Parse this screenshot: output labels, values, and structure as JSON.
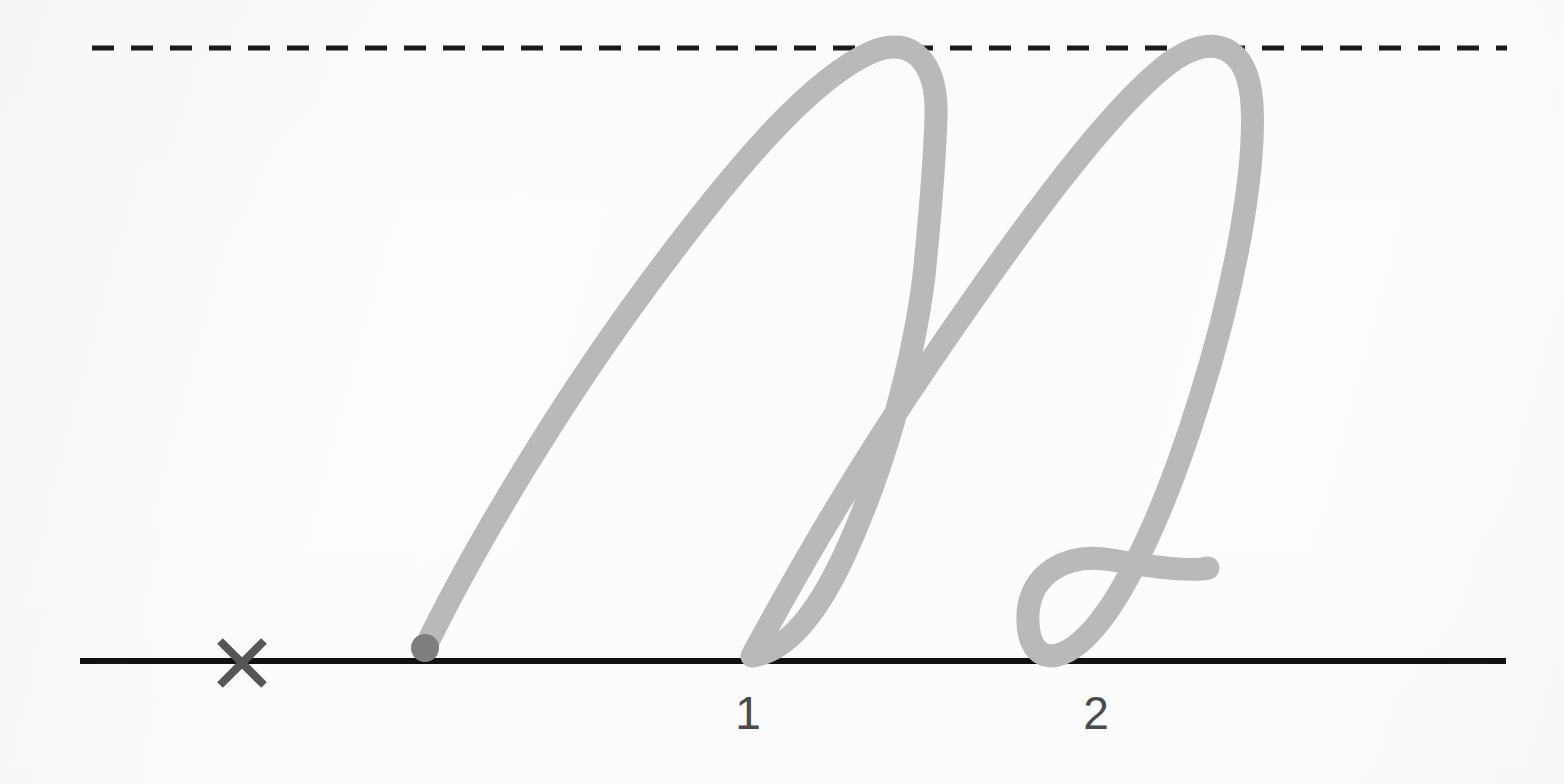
{
  "worksheet": {
    "kind": "cursive-handwriting-practice",
    "letter": "n",
    "letter_case": "lowercase",
    "script": "cursive",
    "background_color": "#fdfdfd"
  },
  "guides": {
    "top_line": {
      "name": "midline-dashed-guide",
      "style": "dashed",
      "color": "#1a1a1a",
      "x_start": 92,
      "x_end": 1507,
      "y": 48,
      "thickness": 5,
      "dash": 22,
      "gap": 17
    },
    "base_line": {
      "name": "baseline-solid-guide",
      "style": "solid",
      "color": "#111111",
      "x_start": 80,
      "x_end": 1506,
      "y": 661,
      "thickness": 6
    }
  },
  "marks": {
    "x_mark": {
      "label": "X",
      "meaning": "start-position-marker",
      "color": "#565656",
      "cx": 242,
      "cy": 663,
      "half_size": 22,
      "thickness": 8
    },
    "start_dot": {
      "meaning": "pen-start-dot",
      "color": "#7e7e7e",
      "cx": 425,
      "cy": 648,
      "radius": 14
    }
  },
  "stroke_order": {
    "numbers": [
      {
        "label": "1",
        "x": 748,
        "y": 690,
        "color": "#4a4a4a"
      },
      {
        "label": "2",
        "x": 1096,
        "y": 690,
        "color": "#4a4a4a"
      }
    ]
  },
  "letter_stroke": {
    "color": "#b9b9b9",
    "width": 23,
    "linecap": "round",
    "linejoin": "round",
    "path": "M 425 648 C 470 555 560 400 668 258 C 740 163 812 78 872 52 C 912 35 938 62 936 118 C 934 178 928 235 924 276 C 912 372 880 480 842 560 C 812 623 782 652 752 656 C 776 612 836 500 930 362 C 1020 230 1108 110 1168 64 C 1212 31 1248 44 1252 104 C 1256 172 1234 290 1200 398 C 1166 508 1124 600 1086 637 C 1052 670 1026 658 1028 614 C 1030 574 1066 552 1112 560 C 1158 568 1192 572 1208 568"
  }
}
